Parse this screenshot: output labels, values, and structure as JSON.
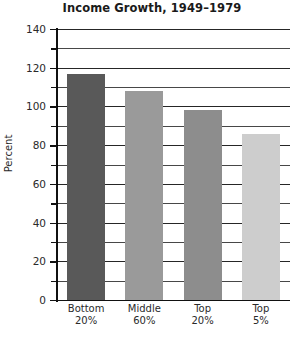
{
  "chart_data": {
    "type": "bar",
    "title": "Income Growth, 1949–1979",
    "xlabel": "",
    "ylabel": "Percent",
    "categories": [
      "Bottom 20%",
      "Middle 60%",
      "Top 20%",
      "Top 5%"
    ],
    "category_lines": [
      [
        "Bottom",
        "20%"
      ],
      [
        "Middle",
        "60%"
      ],
      [
        "Top",
        "20%"
      ],
      [
        "Top",
        "5%"
      ]
    ],
    "values": [
      117,
      108,
      98,
      86
    ],
    "ylim": [
      0,
      140
    ],
    "y_major_step": 20,
    "y_minor_step": 10,
    "grid": true,
    "legend": false,
    "bar_colors": [
      "#595959",
      "#9a9a9a",
      "#8d8d8d",
      "#cdcdcd"
    ],
    "ytick_labels": [
      "0",
      "20",
      "40",
      "60",
      "80",
      "100",
      "120",
      "140"
    ],
    "gridline_values": [
      10,
      20,
      30,
      40,
      50,
      60,
      70,
      80,
      90,
      100,
      110,
      120,
      130,
      140
    ]
  }
}
